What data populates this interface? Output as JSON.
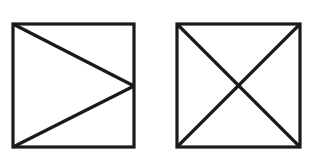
{
  "figure": {
    "canvas": {
      "width": 324,
      "height": 158,
      "background_color": "#ffffff"
    },
    "style": {
      "stroke_color": "#1a1a1a",
      "fill_color": "#ffffff",
      "stroke_width": 3.2
    },
    "shapes": [
      {
        "name": "left-square",
        "description": "Square containing a right-pointing triangle formed by two line segments from the left corners to the midpoint of the right edge",
        "bounds": {
          "x": 13,
          "y": 24,
          "width": 121,
          "height": 123
        },
        "corners": {
          "top_left": [
            13,
            24
          ],
          "top_right": [
            134,
            24
          ],
          "bottom_right": [
            134,
            147
          ],
          "bottom_left": [
            13,
            147
          ]
        },
        "internal_lines": [
          {
            "name": "upper-diagonal",
            "from": [
              13,
              24
            ],
            "to": [
              134,
              86
            ]
          },
          {
            "name": "lower-diagonal",
            "from": [
              13,
              147
            ],
            "to": [
              134,
              86
            ]
          }
        ],
        "apex_point": [
          134,
          86
        ]
      },
      {
        "name": "right-square",
        "description": "Square containing both corner-to-corner diagonals forming an X",
        "bounds": {
          "x": 177,
          "y": 24,
          "width": 123,
          "height": 123
        },
        "corners": {
          "top_left": [
            177,
            24
          ],
          "top_right": [
            300,
            24
          ],
          "bottom_right": [
            300,
            147
          ],
          "bottom_left": [
            177,
            147
          ]
        },
        "internal_lines": [
          {
            "name": "diagonal-tl-br",
            "from": [
              177,
              24
            ],
            "to": [
              300,
              147
            ]
          },
          {
            "name": "diagonal-bl-tr",
            "from": [
              177,
              147
            ],
            "to": [
              300,
              24
            ]
          }
        ],
        "crossing_point": [
          238.5,
          85.5
        ]
      }
    ]
  }
}
